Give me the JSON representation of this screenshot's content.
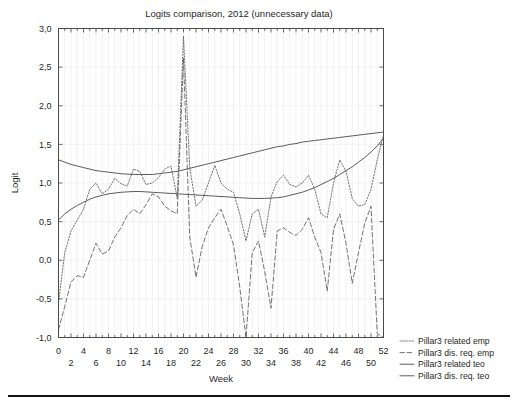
{
  "chart_data": {
    "type": "line",
    "title": "Logits comparison, 2012 (unnecessary data)",
    "xlabel": "Week",
    "ylabel": "Logit",
    "xlim": [
      0,
      52
    ],
    "ylim": [
      -1.0,
      3.0
    ],
    "grid": true,
    "legend_position": "right-outside",
    "ytick_labels": [
      "3,0",
      "2,5",
      "2,0",
      "1,5",
      "1,0",
      "0,5",
      "0,0",
      "-0,5",
      "-1,0"
    ],
    "ytick_values": [
      3.0,
      2.5,
      2.0,
      1.5,
      1.0,
      0.5,
      0.0,
      -0.5,
      -1.0
    ],
    "xtick_labels_top": [
      "0",
      "4",
      "8",
      "12",
      "16",
      "20",
      "24",
      "28",
      "32",
      "36",
      "40",
      "44",
      "48",
      "52"
    ],
    "xtick_values_top": [
      0,
      4,
      8,
      12,
      16,
      20,
      24,
      28,
      32,
      36,
      40,
      44,
      48,
      52
    ],
    "xtick_labels_bottom": [
      "2",
      "6",
      "10",
      "14",
      "18",
      "22",
      "26",
      "30",
      "34",
      "38",
      "42",
      "46",
      "50"
    ],
    "xtick_values_bottom": [
      2,
      6,
      10,
      14,
      18,
      22,
      26,
      30,
      34,
      38,
      42,
      46,
      50
    ],
    "x": [
      0,
      1,
      2,
      3,
      4,
      5,
      6,
      7,
      8,
      9,
      10,
      11,
      12,
      13,
      14,
      15,
      16,
      17,
      18,
      19,
      20,
      21,
      22,
      23,
      24,
      25,
      26,
      27,
      28,
      29,
      30,
      31,
      32,
      33,
      34,
      35,
      36,
      37,
      38,
      39,
      40,
      41,
      42,
      43,
      44,
      45,
      46,
      47,
      48,
      49,
      50,
      51,
      52
    ],
    "series": [
      {
        "name": "Pillar3 related emp",
        "style": "dotted",
        "color": "#5a5a5a",
        "values": [
          -0.55,
          0.1,
          0.38,
          0.52,
          0.66,
          0.92,
          1.0,
          0.86,
          0.92,
          1.06,
          0.99,
          0.96,
          1.18,
          1.15,
          0.98,
          1.0,
          1.07,
          1.18,
          1.22,
          0.8,
          2.9,
          1.2,
          0.7,
          0.78,
          1.0,
          1.23,
          1.0,
          0.92,
          0.88,
          0.6,
          0.25,
          0.6,
          0.66,
          0.3,
          0.82,
          1.02,
          1.1,
          0.98,
          0.95,
          1.0,
          1.1,
          0.92,
          0.6,
          0.55,
          1.0,
          1.3,
          1.15,
          0.8,
          0.7,
          0.72,
          0.92,
          1.3,
          1.62
        ]
      },
      {
        "name": "Pillar3 dis. req. emp",
        "style": "dashed",
        "color": "#5a5a5a",
        "values": [
          -0.9,
          -0.6,
          -0.28,
          -0.2,
          -0.22,
          0.0,
          0.22,
          0.08,
          0.12,
          0.3,
          0.42,
          0.58,
          0.66,
          0.6,
          0.72,
          0.86,
          0.82,
          0.7,
          0.64,
          0.6,
          2.62,
          0.3,
          -0.22,
          0.18,
          0.42,
          0.55,
          0.66,
          0.44,
          0.2,
          -0.35,
          -1.0,
          0.1,
          0.25,
          -0.15,
          -0.62,
          0.38,
          0.42,
          0.36,
          0.32,
          0.4,
          0.55,
          0.3,
          0.1,
          -0.4,
          0.4,
          0.6,
          0.22,
          -0.3,
          0.1,
          0.48,
          0.7,
          -0.95,
          -1.0
        ]
      },
      {
        "name": "Pillar3 related teo",
        "style": "solid",
        "color": "#5a5a5a",
        "values": [
          1.3,
          1.27,
          1.24,
          1.22,
          1.2,
          1.18,
          1.16,
          1.15,
          1.14,
          1.13,
          1.12,
          1.115,
          1.11,
          1.11,
          1.11,
          1.11,
          1.12,
          1.13,
          1.14,
          1.15,
          1.17,
          1.19,
          1.21,
          1.23,
          1.25,
          1.27,
          1.29,
          1.31,
          1.33,
          1.35,
          1.37,
          1.39,
          1.41,
          1.43,
          1.45,
          1.47,
          1.48,
          1.5,
          1.51,
          1.53,
          1.54,
          1.55,
          1.56,
          1.57,
          1.58,
          1.59,
          1.6,
          1.61,
          1.62,
          1.63,
          1.64,
          1.65,
          1.66
        ]
      },
      {
        "name": "Pillar3 dis. req. teo",
        "style": "solid",
        "color": "#5a5a5a",
        "values": [
          0.52,
          0.6,
          0.66,
          0.71,
          0.75,
          0.79,
          0.82,
          0.84,
          0.86,
          0.87,
          0.88,
          0.885,
          0.89,
          0.89,
          0.885,
          0.88,
          0.875,
          0.87,
          0.865,
          0.86,
          0.855,
          0.85,
          0.845,
          0.84,
          0.835,
          0.83,
          0.825,
          0.82,
          0.815,
          0.81,
          0.805,
          0.8,
          0.8,
          0.8,
          0.805,
          0.81,
          0.82,
          0.84,
          0.86,
          0.88,
          0.91,
          0.94,
          0.98,
          1.02,
          1.06,
          1.11,
          1.16,
          1.21,
          1.27,
          1.33,
          1.4,
          1.48,
          1.58
        ]
      }
    ],
    "legend": [
      {
        "label": "Pillar3 related emp",
        "style": "dotted"
      },
      {
        "label": "Pillar3 dis. req. emp",
        "style": "dashed"
      },
      {
        "label": "Pillar3 related teo",
        "style": "solid"
      },
      {
        "label": "Pillar3 dis. req. teo",
        "style": "solid"
      }
    ]
  },
  "colors": {
    "background": "#ffffff",
    "frame": "#4a4a4a",
    "grid": "#e9e9e9",
    "line": "#5a5a5a",
    "text": "#1f1f1f",
    "footer_rule": "#111111"
  }
}
